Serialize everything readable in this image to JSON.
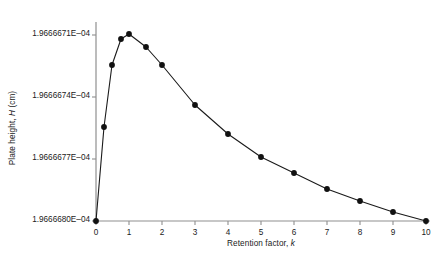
{
  "chart_data": {
    "type": "line",
    "title": "",
    "xlabel_plain": "Retention factor, k",
    "ylabel_plain": "Plate height, H (cm)",
    "xlabel_prefix": "Retention factor, ",
    "xlabel_italic": "k",
    "ylabel_prefix": "Plate height, ",
    "ylabel_italic": "H",
    "ylabel_suffix": " (cm)",
    "xlim": [
      0,
      10
    ],
    "ylim": [
      0.00019666671,
      0.000196666805
    ],
    "grid": false,
    "legend": null,
    "marker": "filled-circle",
    "line_color": "#1a1a1a",
    "marker_color": "#111111",
    "axis_color": "#8a8a8a",
    "xticks": [
      0,
      1,
      2,
      3,
      4,
      5,
      6,
      7,
      8,
      9,
      10
    ],
    "xtick_labels": [
      "0",
      "1",
      "2",
      "3",
      "4",
      "5",
      "6",
      "7",
      "8",
      "9",
      "10"
    ],
    "yticks": [
      0.00019666671,
      0.00019666674,
      0.00019666677,
      0.0001966668
    ],
    "ytick_labels": [
      "1.9666671E–04",
      "1.9666674E–04",
      "1.9666677E–04",
      "1.9666680E–04"
    ],
    "x": [
      0.1,
      0.25,
      0.5,
      0.75,
      1.0,
      1.5,
      2.0,
      3.0,
      4.0,
      5.0,
      6.0,
      7.0,
      8.0,
      9.0,
      10.0
    ],
    "y": [
      0.00019666671,
      0.000196666755,
      0.000196666785,
      0.000196666798,
      0.0001966668,
      0.000196666793,
      0.000196666785,
      0.000196666769,
      0.000196666755,
      0.000196666745,
      0.000196666737,
      0.00019666673,
      0.000196666725,
      0.00019666672,
      0.00019666671
    ],
    "points_px": [
      {
        "x": 96,
        "y": 221
      },
      {
        "x": 104,
        "y": 127
      },
      {
        "x": 112,
        "y": 65
      },
      {
        "x": 121,
        "y": 39
      },
      {
        "x": 129,
        "y": 34
      },
      {
        "x": 146,
        "y": 47
      },
      {
        "x": 162,
        "y": 65
      },
      {
        "x": 195,
        "y": 105
      },
      {
        "x": 228,
        "y": 134
      },
      {
        "x": 261,
        "y": 157
      },
      {
        "x": 294,
        "y": 173
      },
      {
        "x": 327,
        "y": 189
      },
      {
        "x": 360,
        "y": 201
      },
      {
        "x": 393,
        "y": 212
      },
      {
        "x": 426,
        "y": 221
      }
    ]
  },
  "axes": {
    "ytick_px": [
      35,
      97,
      159,
      221
    ],
    "xtick_px": [
      96,
      129,
      162,
      195,
      228,
      261,
      294,
      327,
      360,
      393,
      426
    ],
    "origin_px": {
      "x": 96,
      "y": 221
    },
    "top_px": 22,
    "right_px": 430
  }
}
